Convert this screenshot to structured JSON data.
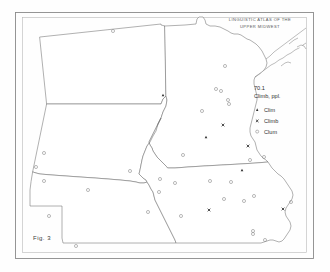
{
  "figure": {
    "caption": "Fig. 3",
    "atlas_title_line1": "LINGUISTIC ATLAS OF THE",
    "atlas_title_line2": "UPPER MIDWEST"
  },
  "legend": {
    "item_number": "70.1",
    "item_word": "Climb, ppl.",
    "entries": [
      {
        "symbol": "triangle",
        "label": "Clim"
      },
      {
        "symbol": "x",
        "label": "Climb"
      },
      {
        "symbol": "circle",
        "label": "Clum"
      }
    ]
  },
  "colors": {
    "frame": "#8a8a8a",
    "state_outline": "#6f6f6f",
    "symbol_open": "#8c8c8c",
    "symbol_filled": "#2a2a2a",
    "text": "#3a3a3a",
    "background": "#fefefe"
  },
  "chart_data": {
    "type": "scatter",
    "title": "LINGUISTIC ATLAS OF THE UPPER MIDWEST",
    "subtitle": "70.1 Climb, ppl.",
    "xlabel": "",
    "ylabel": "",
    "projection": "dot-distribution map of the Upper Midwest (ND, SD, NE, MN, IA)",
    "legend_position": "right-center",
    "grid": false,
    "series": [
      {
        "name": "Clim",
        "symbol": "triangle",
        "points": [
          {
            "x": 163,
            "y": 95
          },
          {
            "x": 206,
            "y": 137
          },
          {
            "x": 242,
            "y": 170
          }
        ]
      },
      {
        "name": "Climb",
        "symbol": "x",
        "points": [
          {
            "x": 223,
            "y": 125
          },
          {
            "x": 248,
            "y": 146
          },
          {
            "x": 209,
            "y": 210
          },
          {
            "x": 283,
            "y": 209
          }
        ]
      },
      {
        "name": "Clum",
        "symbol": "circle",
        "points": [
          {
            "x": 113,
            "y": 31
          },
          {
            "x": 225,
            "y": 66
          },
          {
            "x": 216,
            "y": 89
          },
          {
            "x": 221,
            "y": 91
          },
          {
            "x": 228,
            "y": 100
          },
          {
            "x": 229,
            "y": 104
          },
          {
            "x": 202,
            "y": 111
          },
          {
            "x": 183,
            "y": 155
          },
          {
            "x": 250,
            "y": 160
          },
          {
            "x": 264,
            "y": 157
          },
          {
            "x": 44,
            "y": 153
          },
          {
            "x": 36,
            "y": 167
          },
          {
            "x": 44,
            "y": 181
          },
          {
            "x": 88,
            "y": 190
          },
          {
            "x": 130,
            "y": 171
          },
          {
            "x": 160,
            "y": 179
          },
          {
            "x": 175,
            "y": 183
          },
          {
            "x": 159,
            "y": 192
          },
          {
            "x": 148,
            "y": 212
          },
          {
            "x": 181,
            "y": 216
          },
          {
            "x": 210,
            "y": 181
          },
          {
            "x": 231,
            "y": 182
          },
          {
            "x": 254,
            "y": 196
          },
          {
            "x": 224,
            "y": 199
          },
          {
            "x": 244,
            "y": 201
          },
          {
            "x": 291,
            "y": 202
          },
          {
            "x": 76,
            "y": 246
          },
          {
            "x": 253,
            "y": 231
          },
          {
            "x": 253,
            "y": 234
          },
          {
            "x": 265,
            "y": 240
          },
          {
            "x": 49,
            "y": 216
          }
        ]
      }
    ],
    "counts": {
      "Clim": 3,
      "Climb": 4,
      "Clum": 31
    }
  }
}
